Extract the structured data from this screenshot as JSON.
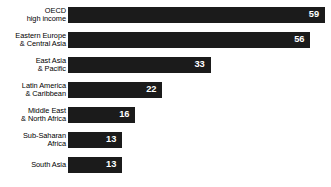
{
  "chart_data": {
    "type": "bar",
    "orientation": "horizontal",
    "title": "",
    "subtitle": "",
    "xlabel": "",
    "ylabel": "",
    "xlim": [
      0,
      59
    ],
    "ylim": null,
    "grid": false,
    "legend": null,
    "bar_color": "#1b1b1b",
    "value_label_color": "#ffffff",
    "background_color": "#ffffff",
    "categories": [
      "OECD\nhigh income",
      "Eastern Europe\n& Central Asia",
      "East Asia\n& Pacific",
      "Latin America\n& Caribbean",
      "Middle East\n& North Africa",
      "Sub-Saharan\nAfrica",
      "South Asia"
    ],
    "values": [
      59,
      56,
      33,
      22,
      16,
      13,
      13
    ],
    "value_labels": [
      "59",
      "56",
      "33",
      "22",
      "16",
      "13",
      "13"
    ],
    "bars": [
      {
        "category": "OECD\nhigh income",
        "value": 59,
        "label": "59",
        "width_pct": 100.0
      },
      {
        "category": "Eastern Europe\n& Central Asia",
        "value": 56,
        "label": "56",
        "width_pct": 94.3
      },
      {
        "category": "East Asia\n& Pacific",
        "value": 33,
        "label": "33",
        "width_pct": 55.5
      },
      {
        "category": "Latin America\n& Caribbean",
        "value": 22,
        "label": "22",
        "width_pct": 36.7
      },
      {
        "category": "Middle East\n& North Africa",
        "value": 16,
        "label": "16",
        "width_pct": 26.2
      },
      {
        "category": "Sub-Saharan\nAfrica",
        "value": 13,
        "label": "13",
        "width_pct": 21.1
      },
      {
        "category": "South Asia",
        "value": 13,
        "label": "13",
        "width_pct": 21.1
      }
    ]
  }
}
